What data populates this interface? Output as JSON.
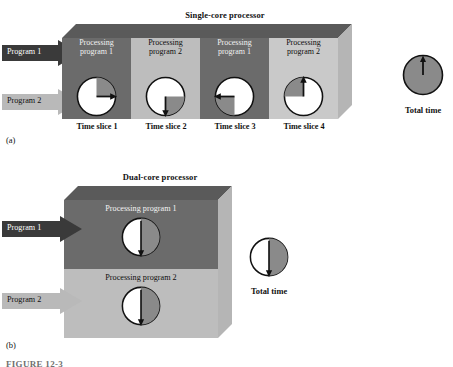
{
  "figure": {
    "caption": "FIGURE 12-3",
    "panel_a_letter": "(a)",
    "panel_b_letter": "(b)"
  },
  "colors": {
    "dark_gray": "#6b6b6b",
    "mid_gray": "#808080",
    "light_gray": "#bdbdbd",
    "lighter_gray": "#c9c9c9",
    "top_face_dark": "#5a5a5a",
    "top_face_light": "#a8a8a8",
    "side_face": "#b5b5b5",
    "clock_fill": "#ffffff",
    "clock_shade": "#8a8a8a",
    "clock_stroke": "#111111",
    "arrow_dark": "#3a3a3a",
    "arrow_light": "#b9b9b9",
    "total_time_fill": "#8a8a8a"
  },
  "panel_a": {
    "title": "Single-core processor",
    "arrows": [
      {
        "label": "Program 1",
        "style": "dark"
      },
      {
        "label": "Program 2",
        "style": "light"
      }
    ],
    "slices": [
      {
        "line1": "Processing",
        "line2": "program 1",
        "slice_label": "Time slice 1",
        "shade": "dark",
        "clock": {
          "start_deg": 0,
          "end_deg": 90,
          "hand_deg": 90,
          "elapsed_fraction": 0.25
        }
      },
      {
        "line1": "Processing",
        "line2": "program 2",
        "slice_label": "Time slice 2",
        "shade": "light",
        "clock": {
          "start_deg": 90,
          "end_deg": 180,
          "hand_deg": 180,
          "elapsed_fraction": 0.5
        }
      },
      {
        "line1": "Processing",
        "line2": "program 1",
        "slice_label": "Time slice 3",
        "shade": "dark",
        "clock": {
          "start_deg": 180,
          "end_deg": 270,
          "hand_deg": 270,
          "elapsed_fraction": 0.75
        }
      },
      {
        "line1": "Processing",
        "line2": "program 2",
        "slice_label": "Time slice 4",
        "shade": "light",
        "clock": {
          "start_deg": 270,
          "end_deg": 360,
          "hand_deg": 360,
          "elapsed_fraction": 1.0
        }
      }
    ],
    "total_time": {
      "label": "Total time",
      "clock": {
        "fraction_filled": 1.0,
        "hand_deg": 0
      }
    }
  },
  "panel_b": {
    "title": "Dual-core processor",
    "arrows": [
      {
        "label": "Program 1",
        "style": "dark"
      },
      {
        "label": "Program 2",
        "style": "light"
      }
    ],
    "bands": [
      {
        "label": "Processing program 1",
        "shade": "dark",
        "clock": {
          "start_deg": 0,
          "end_deg": 180,
          "hand_deg": 180,
          "elapsed_fraction": 0.5
        }
      },
      {
        "label": "Processing program 2",
        "shade": "light",
        "clock": {
          "start_deg": 0,
          "end_deg": 180,
          "hand_deg": 180,
          "elapsed_fraction": 0.5
        }
      }
    ],
    "total_time": {
      "label": "Total time",
      "clock": {
        "fraction_filled": 0.5,
        "hand_deg": 180
      }
    }
  }
}
